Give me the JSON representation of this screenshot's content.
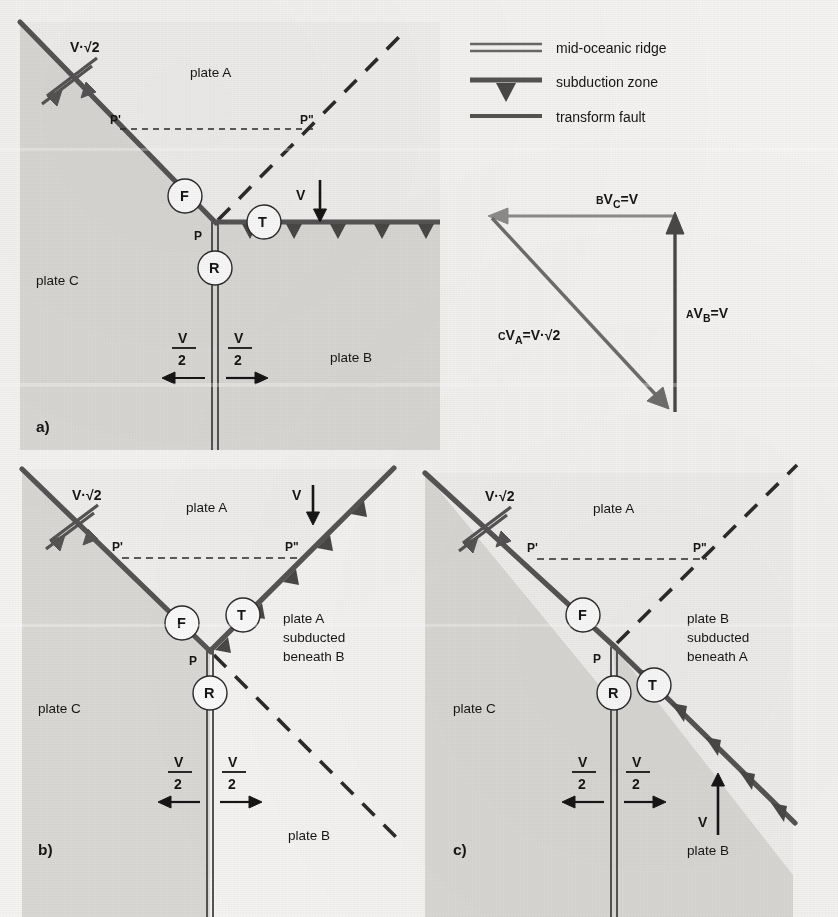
{
  "figure": {
    "panels": [
      "a)",
      "b)",
      "c)"
    ]
  },
  "legend": {
    "items": [
      {
        "symbol": "double-line",
        "icon": "mid-oceanic-ridge-icon",
        "label": "mid-oceanic ridge"
      },
      {
        "symbol": "line-with-teeth",
        "icon": "subduction-zone-icon",
        "label": "subduction zone"
      },
      {
        "symbol": "single-thick-line",
        "icon": "transform-fault-icon",
        "label": "transform fault"
      }
    ]
  },
  "panel_a": {
    "tag": "a)",
    "plate_a": "plate A",
    "plate_b": "plate B",
    "plate_c": "plate C",
    "junction": "P",
    "point_prime": "P'",
    "point_double_prime": "P\"",
    "fault_label": "F",
    "trench_label": "T",
    "ridge_label": "R",
    "velocity_transform": "V·√2",
    "velocity_v": "V",
    "velocity_half_left": "V/2",
    "velocity_half_right": "V/2",
    "half_numerator": "V",
    "half_denominator": "2"
  },
  "panel_b": {
    "tag": "b)",
    "plate_a": "plate A",
    "plate_b": "plate B",
    "plate_c": "plate C",
    "junction": "P",
    "point_prime": "P'",
    "point_double_prime": "P\"",
    "fault_label": "F",
    "trench_label": "T",
    "ridge_label": "R",
    "velocity_transform": "V·√2",
    "velocity_v": "V",
    "half_numerator": "V",
    "half_denominator": "2",
    "note_line1": "plate A",
    "note_line2": "subducted",
    "note_line3": "beneath B"
  },
  "panel_c": {
    "tag": "c)",
    "plate_a": "plate A",
    "plate_b": "plate B",
    "plate_c": "plate C",
    "junction": "P",
    "point_prime": "P'",
    "point_double_prime": "P\"",
    "fault_label": "F",
    "trench_label": "T",
    "ridge_label": "R",
    "velocity_transform": "V·√2",
    "velocity_v": "V",
    "half_numerator": "V",
    "half_denominator": "2",
    "note_line1": "plate B",
    "note_line2": "subducted",
    "note_line3": "beneath A"
  },
  "velocity_triangle": {
    "vec_bc_pre": "B",
    "vec_bc_main": "V",
    "vec_bc_sub": "C",
    "vec_bc_post": "=V",
    "vec_ab_pre": "A",
    "vec_ab_main": "V",
    "vec_ab_sub": "B",
    "vec_ab_post": "=V",
    "vec_ca_pre": "C",
    "vec_ca_main": "V",
    "vec_ca_sub": "A",
    "vec_ca_post": "=V·√2"
  },
  "colors": {
    "plate_a_fill": "#efeeed",
    "plate_bc_fill": "#dad8d5",
    "structure_line": "#555353",
    "vector_dark": "#4a4847",
    "vector_light": "#8e8c8a",
    "text": "#161616"
  }
}
